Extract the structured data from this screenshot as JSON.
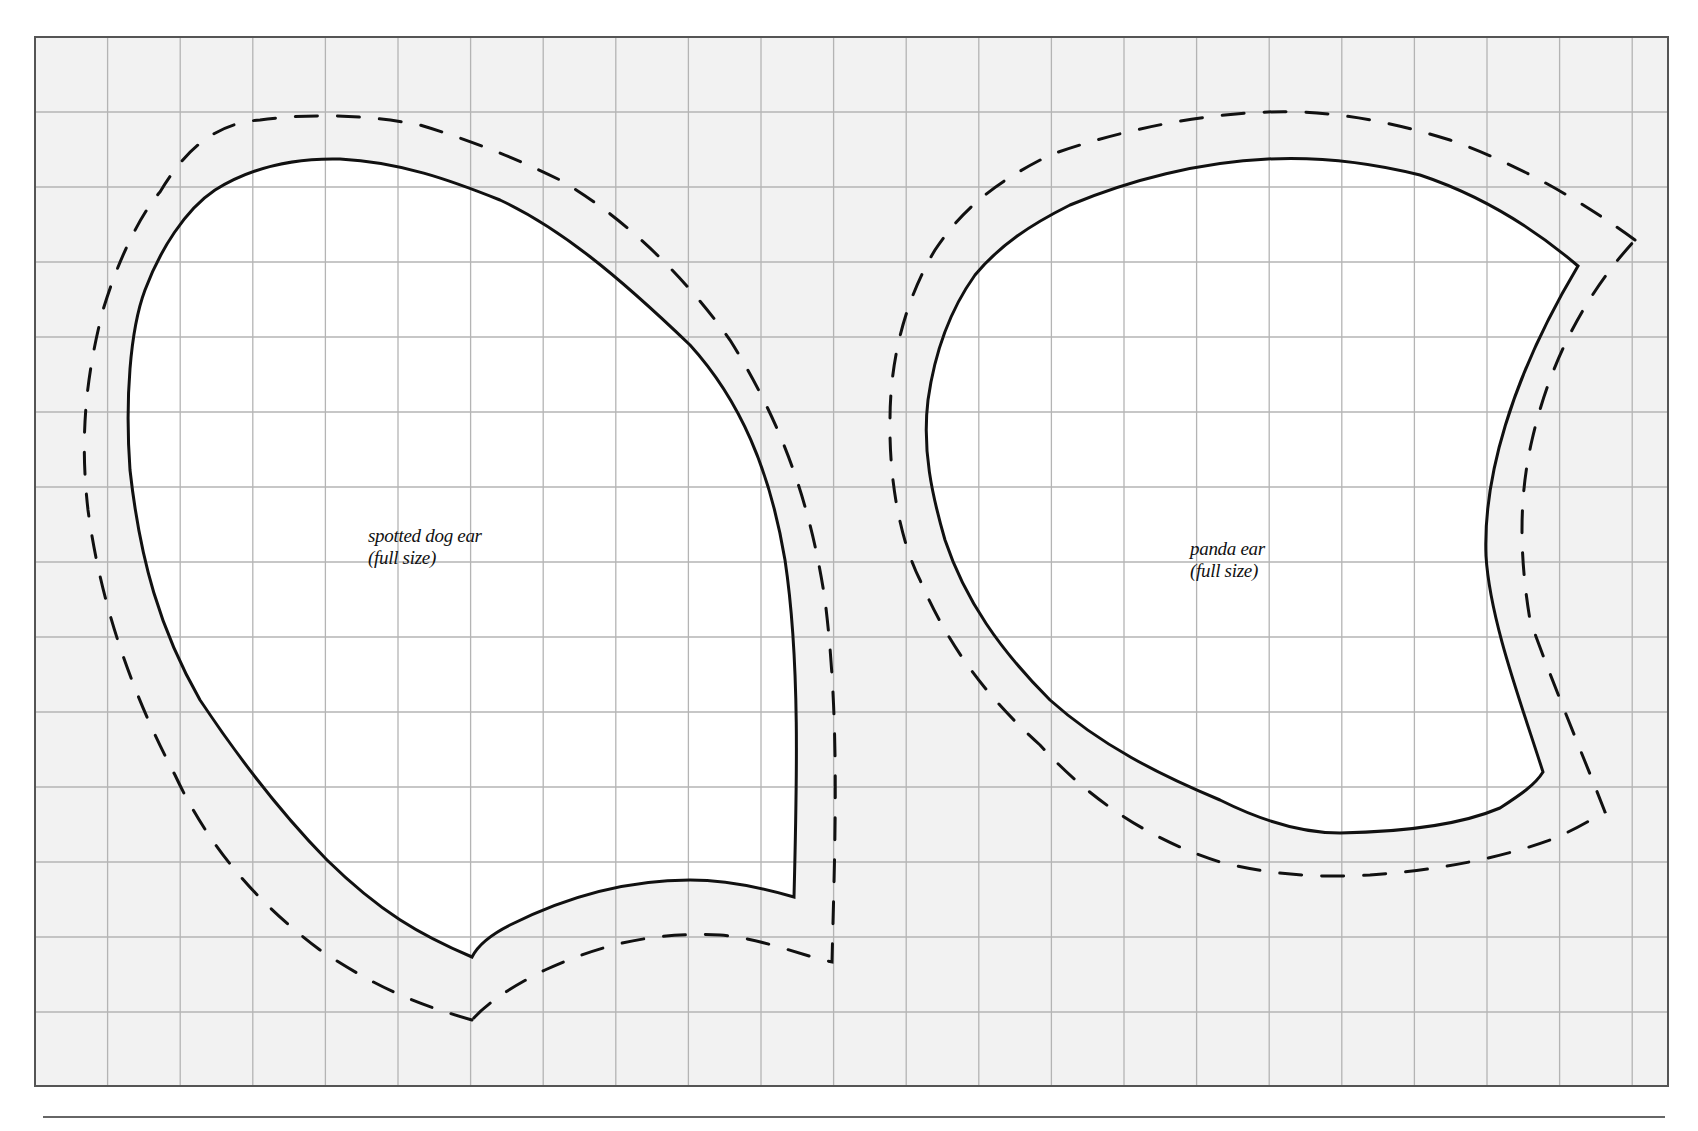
{
  "page": {
    "background": "#ffffff",
    "grid_fill": "#f2f2f2",
    "grid_line_color": "#b4b4b4",
    "border_color": "#555555",
    "outline_color": "#111111"
  },
  "grid": {
    "left": 35,
    "top": 37,
    "right": 1668,
    "bottom": 1086,
    "cell_width": 72.6,
    "cell_height": 75
  },
  "rule": {
    "x1": 43,
    "x2": 1665,
    "y": 1117
  },
  "patterns": [
    {
      "id": "spotted-dog-ear",
      "label_line1": "spotted dog ear",
      "label_line2": "(full size)",
      "label_pos": {
        "x": 368,
        "y": 525
      },
      "cut_line": "M 472 957 C 420 935, 380 912, 327 860 C 280 812, 240 760, 200 700 C 160 630, 140 560, 130 470 C 125 400, 130 330, 145 290 C 160 250, 185 210, 215 190 C 255 165, 300 158, 340 159 C 400 162, 450 180, 500 200 C 560 228, 617 275, 690 345 C 740 400, 770 470, 785 560 C 800 660, 797 780, 794 897 C 770 890, 730 880, 690 880 C 620 880, 560 900, 510 925 C 490 935, 478 945, 472 957 Z",
      "seam_line": "M 472 1020 C 420 1005, 380 990, 320 950 C 260 905, 210 850, 175 775 C 130 690, 100 600, 88 510 C 80 440, 85 380, 103 310 C 118 260, 140 215, 160 192 C 185 150, 215 123, 260 120 C 310 113, 370 115, 420 125 C 470 140, 520 160, 560 180 C 620 215, 680 270, 730 340 C 780 420, 810 500, 825 600 C 840 720, 835 840, 832 962 C 800 955, 760 938, 720 935 C 650 932, 600 945, 545 970 C 510 987, 485 1005, 472 1020 Z"
    },
    {
      "id": "panda-ear",
      "label_line1": "panda ear",
      "label_line2": "(full size)",
      "label_pos": {
        "x": 1190,
        "y": 538
      },
      "cut_line": "M 1578 266 C 1530 225, 1480 195, 1420 175 C 1360 160, 1310 157, 1268 159 C 1200 162, 1130 180, 1070 205 C 1030 225, 1000 245, 975 275 C 950 310, 935 350, 928 400 C 922 450, 932 495, 945 540 C 965 600, 1000 650, 1050 700 C 1100 745, 1160 775, 1220 800 C 1260 820, 1300 833, 1340 833 C 1400 832, 1460 825, 1500 808 C 1520 795, 1535 785, 1543 772 C 1520 700, 1490 620, 1486 556 C 1483 480, 1510 380, 1578 266 Z",
      "seam_line": "M 1635 240 C 1580 200, 1520 165, 1450 140 C 1380 118, 1320 110, 1268 112 C 1200 114, 1120 130, 1050 155 C 1000 180, 965 205, 935 250 C 905 300, 890 360, 890 420 C 889 480, 900 540, 920 580 C 950 650, 990 700, 1040 745 C 1090 800, 1150 840, 1220 862 C 1270 875, 1320 878, 1370 875 C 1440 870, 1500 858, 1550 840 C 1575 830, 1590 820, 1605 812 C 1585 760, 1555 690, 1530 620 C 1520 560, 1518 500, 1532 440 C 1548 370, 1580 300, 1635 240 Z"
    }
  ]
}
